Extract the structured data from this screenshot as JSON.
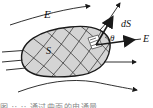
{
  "figure": {
    "labels": {
      "field": "E",
      "field_right": "E",
      "surface": "S",
      "area_element": "dS",
      "angle": "θ"
    },
    "caption_partial": "图 ·· ·· 通过曲面的电通量",
    "colors": {
      "stroke": "#1a1a1a",
      "surface_fill": "#d4d4d4",
      "background": "#ffffff"
    }
  }
}
